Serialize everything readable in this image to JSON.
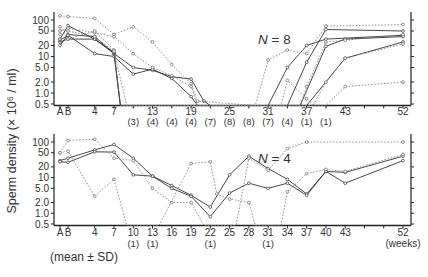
{
  "ylabel": "Sperm density (× 10⁶ / ml)",
  "footnote": "(mean ± SD)",
  "x_unit_label": "(weeks)",
  "chart_data": [
    {
      "type": "line",
      "title": "N = 8",
      "ylabel": "Sperm density (× 10^6 / ml)",
      "yscale": "log",
      "ylim": [
        0.5,
        100
      ],
      "yticks": [
        100,
        50,
        20,
        10,
        5.0,
        2.0,
        1.0,
        0.5
      ],
      "ytick_labels": [
        "100",
        "50",
        "20",
        "10",
        "5.0",
        "2.0",
        "1.0",
        "0.5"
      ],
      "xtick_labels": [
        "A",
        "B",
        "4",
        "7",
        "13",
        "19",
        "25",
        "31",
        "37",
        "43",
        "52"
      ],
      "xtick_values": [
        "A",
        "B",
        4,
        7,
        13,
        19,
        25,
        31,
        37,
        43,
        52
      ],
      "n_annotations": [
        {
          "week": 10,
          "label": "(3)"
        },
        {
          "week": 13,
          "label": "(4)"
        },
        {
          "week": 16,
          "label": "(4)"
        },
        {
          "week": 19,
          "label": "(4)"
        },
        {
          "week": 22,
          "label": "(7)"
        },
        {
          "week": 25,
          "label": "(8)"
        },
        {
          "week": 28,
          "label": "(8)"
        },
        {
          "week": 31,
          "label": "(7)"
        },
        {
          "week": 34,
          "label": "(4)"
        },
        {
          "week": 37,
          "label": "(1)"
        },
        {
          "week": 40,
          "label": "(1)"
        }
      ],
      "series": [
        {
          "name": "subject 1",
          "style": "solid",
          "points": [
            [
              "A",
              25
            ],
            [
              "B",
              30
            ],
            [
              4,
              30
            ],
            [
              7,
              12
            ],
            [
              10,
              5
            ],
            [
              13,
              4.2
            ],
            [
              16,
              2.8
            ],
            [
              19,
              2.4
            ],
            [
              21,
              0.6
            ],
            [
              22,
              0.5
            ],
            [
              31,
              0.5
            ],
            [
              34,
              5
            ],
            [
              37,
              20
            ],
            [
              40,
              30
            ],
            [
              52,
              38
            ]
          ]
        },
        {
          "name": "subject 2",
          "style": "solid",
          "points": [
            [
              "A",
              20
            ],
            [
              "B",
              40
            ],
            [
              4,
              35
            ],
            [
              7,
              12
            ],
            [
              8,
              0.5
            ],
            [
              34,
              0.5
            ],
            [
              37,
              7
            ],
            [
              40,
              55
            ],
            [
              52,
              50
            ]
          ]
        },
        {
          "name": "subject 3",
          "style": "solid",
          "points": [
            [
              "A",
              28
            ],
            [
              "B",
              38
            ],
            [
              4,
              12
            ],
            [
              7,
              10
            ],
            [
              10,
              3.3
            ],
            [
              13,
              4.5
            ],
            [
              16,
              2.5
            ],
            [
              19,
              0.8
            ],
            [
              20,
              0.5
            ],
            [
              37,
              0.5
            ],
            [
              43,
              9
            ],
            [
              52,
              25
            ]
          ]
        },
        {
          "name": "subject 4",
          "style": "solid",
          "points": [
            [
              "A",
              30
            ],
            [
              "B",
              70
            ],
            [
              4,
              30
            ],
            [
              7,
              13
            ],
            [
              8,
              0.5
            ],
            [
              36,
              0.5
            ],
            [
              40,
              19
            ],
            [
              43,
              30
            ],
            [
              52,
              35
            ]
          ]
        },
        {
          "name": "subject 5",
          "style": "dotted",
          "points": [
            [
              "A",
              130
            ],
            [
              "B",
              125
            ],
            [
              4,
              110
            ],
            [
              7,
              40
            ],
            [
              10,
              65
            ],
            [
              13,
              25
            ],
            [
              16,
              6
            ],
            [
              19,
              1.8
            ],
            [
              20,
              0.6
            ],
            [
              29,
              0.5
            ],
            [
              31,
              8
            ],
            [
              34,
              15
            ],
            [
              37,
              12
            ],
            [
              40,
              68
            ],
            [
              52,
              75
            ]
          ]
        },
        {
          "name": "subject 6",
          "style": "dotted",
          "points": [
            [
              "A",
              50
            ],
            [
              "B",
              60
            ],
            [
              4,
              45
            ],
            [
              7,
              35
            ],
            [
              10,
              12
            ],
            [
              13,
              5
            ],
            [
              16,
              3
            ],
            [
              19,
              1.5
            ],
            [
              20,
              0.5
            ],
            [
              36,
              0.5
            ],
            [
              37,
              1.5
            ],
            [
              40,
              25
            ],
            [
              43,
              28
            ],
            [
              52,
              40
            ]
          ]
        },
        {
          "name": "subject 7",
          "style": "dotted",
          "points": [
            [
              "A",
              65
            ],
            [
              "B",
              30
            ],
            [
              4,
              50
            ],
            [
              7,
              15
            ],
            [
              8,
              0.5
            ],
            [
              33,
              0.5
            ],
            [
              34,
              2.2
            ],
            [
              37,
              0.7
            ],
            [
              38,
              0.5
            ],
            [
              40,
              2
            ],
            [
              43,
              9
            ],
            [
              52,
              22
            ]
          ]
        },
        {
          "name": "subject 8",
          "style": "dotted",
          "points": [
            [
              "A",
              40
            ],
            [
              "B",
              50
            ],
            [
              4,
              35
            ],
            [
              7,
              14
            ],
            [
              9,
              0.5
            ],
            [
              40,
              0.5
            ],
            [
              43,
              1.5
            ],
            [
              52,
              2.0
            ]
          ]
        }
      ]
    },
    {
      "type": "line",
      "title": "N = 4",
      "ylabel": "Sperm density (× 10^6 / ml)",
      "yscale": "log",
      "ylim": [
        0.5,
        100
      ],
      "yticks": [
        100,
        50,
        20,
        10,
        5.0,
        2.0,
        1.0,
        0.5
      ],
      "ytick_labels": [
        "100",
        "50",
        "20",
        "10",
        "5.0",
        "2.0",
        "1.0",
        "0.5"
      ],
      "xtick_labels": [
        "A",
        "B",
        "4",
        "7",
        "10",
        "13",
        "16",
        "19",
        "22",
        "25",
        "28",
        "31",
        "34",
        "37",
        "40",
        "43",
        "52"
      ],
      "xtick_values": [
        "A",
        "B",
        4,
        7,
        10,
        13,
        16,
        19,
        22,
        25,
        28,
        31,
        34,
        37,
        40,
        43,
        52
      ],
      "n_annotations": [
        {
          "week": 10,
          "label": "(1)"
        },
        {
          "week": 13,
          "label": "(1)"
        },
        {
          "week": 22,
          "label": "(1)"
        },
        {
          "week": 31,
          "label": "(1)"
        }
      ],
      "series": [
        {
          "name": "subject 1",
          "style": "solid",
          "points": [
            [
              "A",
              30
            ],
            [
              "B",
              35
            ],
            [
              4,
              60
            ],
            [
              7,
              85
            ],
            [
              10,
              35
            ],
            [
              13,
              11
            ],
            [
              16,
              6
            ],
            [
              19,
              3.2
            ],
            [
              22,
              1.5
            ],
            [
              25,
              12
            ],
            [
              28,
              40
            ],
            [
              31,
              18
            ],
            [
              34,
              9
            ],
            [
              37,
              3.5
            ],
            [
              40,
              15
            ],
            [
              43,
              14
            ],
            [
              52,
              40
            ]
          ]
        },
        {
          "name": "subject 2",
          "style": "solid",
          "points": [
            [
              "A",
              28
            ],
            [
              "B",
              27
            ],
            [
              4,
              53
            ],
            [
              7,
              52
            ],
            [
              10,
              12
            ],
            [
              13,
              11
            ],
            [
              16,
              5
            ],
            [
              19,
              3.0
            ],
            [
              22,
              0.8
            ],
            [
              25,
              3.7
            ],
            [
              28,
              7
            ],
            [
              31,
              5
            ],
            [
              34,
              7
            ],
            [
              37,
              3.2
            ],
            [
              40,
              15
            ],
            [
              43,
              7
            ],
            [
              52,
              30
            ]
          ]
        },
        {
          "name": "subject 3",
          "style": "dotted",
          "points": [
            [
              "A",
              50
            ],
            [
              "B",
              110
            ],
            [
              4,
              120
            ],
            [
              7,
              35
            ],
            [
              10,
              30
            ],
            [
              13,
              5
            ],
            [
              16,
              2.0
            ],
            [
              19,
              2.0
            ],
            [
              21,
              0.5
            ],
            [
              26,
              0.5
            ],
            [
              28,
              35
            ],
            [
              31,
              16
            ],
            [
              34,
              65
            ],
            [
              37,
              100
            ],
            [
              52,
              100
            ]
          ]
        },
        {
          "name": "subject 4",
          "style": "dotted",
          "points": [
            [
              "A",
              50
            ],
            [
              "B",
              55
            ],
            [
              4,
              3.0
            ],
            [
              7,
              9
            ],
            [
              9,
              0.5
            ],
            [
              14,
              0.5
            ],
            [
              19,
              25
            ],
            [
              22,
              28
            ],
            [
              23,
              3.5
            ],
            [
              25,
              2.5
            ],
            [
              28,
              2.0
            ],
            [
              29,
              0.5
            ],
            [
              33,
              0.5
            ],
            [
              34,
              4
            ],
            [
              37,
              13
            ],
            [
              40,
              17
            ],
            [
              43,
              15
            ],
            [
              52,
              45
            ]
          ]
        }
      ]
    }
  ]
}
